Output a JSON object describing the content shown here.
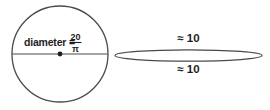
{
  "figure": {
    "circle": {
      "label_prefix": "diameter =",
      "fraction": {
        "numerator": "20",
        "denominator": "π"
      }
    },
    "ellipse": {
      "top_label": "≈ 10",
      "bottom_label": "≈ 10"
    }
  },
  "colors": {
    "stroke": "#4a4a4a",
    "text": "#1f1f1f",
    "background": "#ffffff"
  }
}
